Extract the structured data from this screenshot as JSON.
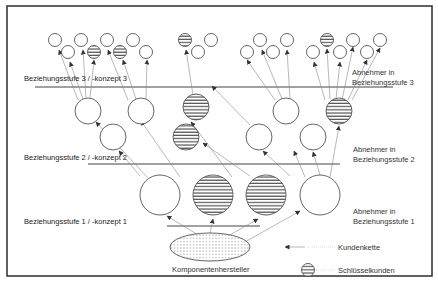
{
  "frame": {
    "x": 7,
    "y": 6,
    "width": 425,
    "height": 270,
    "border_color": "#3a3a3a"
  },
  "colors": {
    "stroke": "#555555",
    "arrow": "#888888",
    "stripe": "#444444",
    "dots": "#777777"
  },
  "levels": [
    {
      "id": "level-3",
      "label": "Beziehungsstufe 3 / -konzept 3",
      "label_x": 24,
      "label_y": 74,
      "line": {
        "x1": 35,
        "x2": 393,
        "y": 87
      },
      "side_label_line1": "Abnehmer in",
      "side_label_line2": "Beziehungsstufe 3",
      "side_x": 352,
      "side_y": 68
    },
    {
      "id": "level-2",
      "label": "Beziehungsstufe 2 / -konzept 2",
      "label_x": 24,
      "label_y": 153,
      "line": {
        "x1": 88,
        "x2": 340,
        "y": 164
      },
      "side_label_line1": "Abnehmer in",
      "side_label_line2": "Beziehungsstufe 2",
      "side_x": 353,
      "side_y": 145
    },
    {
      "id": "level-1",
      "label": "Beziehungsstufe 1 / -konzept 1",
      "label_x": 24,
      "label_y": 217,
      "line": {
        "x1": 167,
        "x2": 260,
        "y": 226
      },
      "side_label_line1": "Abnehmer in",
      "side_label_line2": "Beziehungsstufe 1",
      "side_x": 353,
      "side_y": 207
    }
  ],
  "manufacturer": {
    "label": "Komponentenhersteller",
    "cx": 210,
    "cy": 247,
    "rx": 40,
    "ry": 14,
    "label_x": 172,
    "label_y": 265
  },
  "level1_nodes": [
    {
      "cx": 160,
      "cy": 195,
      "r": 20,
      "key": false
    },
    {
      "cx": 213,
      "cy": 195,
      "r": 20,
      "key": true
    },
    {
      "cx": 266,
      "cy": 195,
      "r": 20,
      "key": true
    },
    {
      "cx": 320,
      "cy": 195,
      "r": 20,
      "key": false
    }
  ],
  "level2_nodes": [
    {
      "cx": 88,
      "cy": 111,
      "r": 13,
      "key": false
    },
    {
      "cx": 113,
      "cy": 137,
      "r": 13,
      "key": false
    },
    {
      "cx": 141,
      "cy": 111,
      "r": 13,
      "key": false
    },
    {
      "cx": 196,
      "cy": 107,
      "r": 13,
      "key": true
    },
    {
      "cx": 186,
      "cy": 137,
      "r": 13,
      "key": true
    },
    {
      "cx": 259,
      "cy": 137,
      "r": 13,
      "key": false
    },
    {
      "cx": 286,
      "cy": 111,
      "r": 13,
      "key": false
    },
    {
      "cx": 313,
      "cy": 137,
      "r": 13,
      "key": false
    },
    {
      "cx": 339,
      "cy": 111,
      "r": 13,
      "key": true
    }
  ],
  "level3_nodes": [
    {
      "cx": 55,
      "cy": 40,
      "r": 6.5,
      "key": false
    },
    {
      "cx": 68,
      "cy": 52,
      "r": 6.5,
      "key": false
    },
    {
      "cx": 81,
      "cy": 40,
      "r": 6.5,
      "key": false
    },
    {
      "cx": 94,
      "cy": 52,
      "r": 6.5,
      "key": true
    },
    {
      "cx": 107,
      "cy": 40,
      "r": 6.5,
      "key": false
    },
    {
      "cx": 120,
      "cy": 52,
      "r": 6.5,
      "key": true
    },
    {
      "cx": 133,
      "cy": 40,
      "r": 6.5,
      "key": false
    },
    {
      "cx": 146,
      "cy": 52,
      "r": 6.5,
      "key": false
    },
    {
      "cx": 185,
      "cy": 40,
      "r": 6.5,
      "key": true
    },
    {
      "cx": 198,
      "cy": 52,
      "r": 6.5,
      "key": false
    },
    {
      "cx": 211,
      "cy": 40,
      "r": 6.5,
      "key": false
    },
    {
      "cx": 247,
      "cy": 52,
      "r": 6.5,
      "key": false
    },
    {
      "cx": 260,
      "cy": 40,
      "r": 6.5,
      "key": false
    },
    {
      "cx": 273,
      "cy": 52,
      "r": 6.5,
      "key": false
    },
    {
      "cx": 287,
      "cy": 40,
      "r": 6.5,
      "key": false
    },
    {
      "cx": 313,
      "cy": 52,
      "r": 6.5,
      "key": false
    },
    {
      "cx": 327,
      "cy": 40,
      "r": 6.5,
      "key": true
    },
    {
      "cx": 340,
      "cy": 52,
      "r": 6.5,
      "key": false
    },
    {
      "cx": 353,
      "cy": 40,
      "r": 6.5,
      "key": false
    },
    {
      "cx": 367,
      "cy": 52,
      "r": 6.5,
      "key": false
    },
    {
      "cx": 380,
      "cy": 40,
      "r": 6.5,
      "key": false
    }
  ],
  "arrows": [
    [
      200,
      236,
      167,
      216
    ],
    [
      210,
      233,
      213,
      219
    ],
    [
      228,
      236,
      258,
      219
    ],
    [
      245,
      242,
      300,
      211
    ],
    [
      148,
      178,
      96,
      122
    ],
    [
      140,
      176,
      119,
      151
    ],
    [
      180,
      177,
      141,
      121
    ],
    [
      232,
      177,
      191,
      122
    ],
    [
      250,
      176,
      203,
      143
    ],
    [
      290,
      176,
      263,
      151
    ],
    [
      305,
      177,
      294,
      151
    ],
    [
      320,
      175,
      313,
      152
    ],
    [
      330,
      177,
      339,
      126
    ],
    [
      78,
      100,
      59,
      50
    ],
    [
      83,
      99,
      70,
      62
    ],
    [
      86,
      98,
      83,
      50
    ],
    [
      90,
      98,
      94,
      60
    ],
    [
      128,
      100,
      108,
      50
    ],
    [
      136,
      99,
      123,
      60
    ],
    [
      146,
      99,
      147,
      60
    ],
    [
      193,
      95,
      186,
      50
    ],
    [
      250,
      125,
      212,
      86
    ],
    [
      275,
      100,
      247,
      60
    ],
    [
      282,
      99,
      262,
      50
    ],
    [
      290,
      99,
      287,
      50
    ],
    [
      325,
      100,
      314,
      62
    ],
    [
      330,
      99,
      327,
      49
    ],
    [
      336,
      99,
      340,
      62
    ],
    [
      342,
      100,
      353,
      47
    ],
    [
      348,
      100,
      367,
      60
    ],
    [
      352,
      100,
      380,
      48
    ]
  ],
  "legend": {
    "chain_label": "Kundenkette",
    "key_label": "Schlüsselkunden",
    "chain_arrow": {
      "x1": 305,
      "y1": 247,
      "x2": 285,
      "y2": 247
    },
    "chain_label_x": 338,
    "chain_label_y": 243,
    "key_icon": {
      "cx": 308,
      "cy": 270,
      "r": 6.5
    },
    "key_label_x": 338,
    "key_label_y": 266
  }
}
